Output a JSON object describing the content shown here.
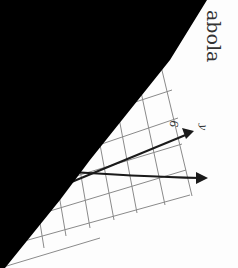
{
  "page": {
    "heading_fragment": "abola",
    "axis_labels": {
      "y": "y",
      "tick": "6"
    },
    "colors": {
      "mask": "#000000",
      "grid": "#8a8a8a",
      "curve": "#1a1a1a",
      "paper": "#fdfdfd"
    }
  }
}
